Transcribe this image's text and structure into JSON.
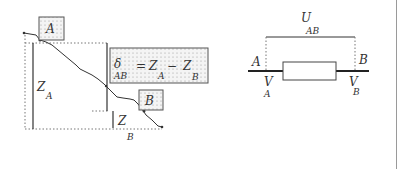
{
  "left_diagram": {
    "point_a_label": "A",
    "point_b_label": "B",
    "height_a": {
      "symbol": "Z",
      "subscript": "A"
    },
    "height_b": {
      "symbol": "Z",
      "subscript": "B"
    },
    "formula": {
      "lhs_symbol": "δ",
      "lhs_subscript": "AB",
      "equals": "=",
      "term1_symbol": "Z",
      "term1_subscript": "A",
      "minus": "−",
      "term2_symbol": "Z",
      "term2_subscript": "B"
    }
  },
  "right_diagram": {
    "voltage": {
      "symbol": "U",
      "subscript": "AB"
    },
    "node_a_label": "A",
    "node_b_label": "B",
    "potential_a": {
      "symbol": "V",
      "subscript": "A"
    },
    "potential_b": {
      "symbol": "V",
      "subscript": "B"
    }
  },
  "colors": {
    "line": "#333333",
    "dotted": "#777777",
    "box_fill": "#ececec",
    "border": "#9a9a9a"
  }
}
